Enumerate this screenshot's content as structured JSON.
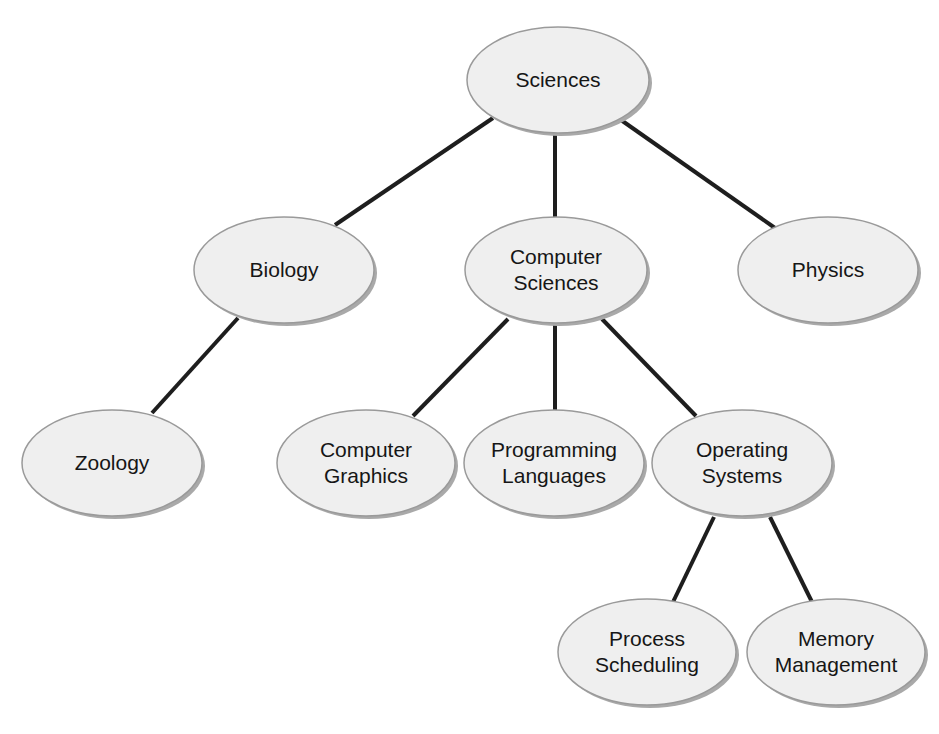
{
  "diagram": {
    "type": "tree",
    "colors": {
      "background": "#ffffff",
      "node_fill": "#efefef",
      "node_stroke": "#9a9a9a",
      "node_shadow": "#a9a9a9",
      "edge": "#1e1e1e",
      "text": "#161616"
    },
    "nodes": [
      {
        "id": "sciences",
        "lines": [
          "Sciences"
        ],
        "cx": 558,
        "cy": 80,
        "rx": 91,
        "ry": 53
      },
      {
        "id": "biology",
        "lines": [
          "Biology"
        ],
        "cx": 284,
        "cy": 270,
        "rx": 90,
        "ry": 53
      },
      {
        "id": "computer-sciences",
        "lines": [
          "Computer",
          "Sciences"
        ],
        "cx": 556,
        "cy": 270,
        "rx": 91,
        "ry": 53
      },
      {
        "id": "physics",
        "lines": [
          "Physics"
        ],
        "cx": 828,
        "cy": 270,
        "rx": 90,
        "ry": 53
      },
      {
        "id": "zoology",
        "lines": [
          "Zoology"
        ],
        "cx": 112,
        "cy": 463,
        "rx": 90,
        "ry": 53
      },
      {
        "id": "computer-graphics",
        "lines": [
          "Computer",
          "Graphics"
        ],
        "cx": 366,
        "cy": 463,
        "rx": 89,
        "ry": 53
      },
      {
        "id": "programming-languages",
        "lines": [
          "Programming",
          "Languages"
        ],
        "cx": 554,
        "cy": 463,
        "rx": 90,
        "ry": 53
      },
      {
        "id": "operating-systems",
        "lines": [
          "Operating",
          "Systems"
        ],
        "cx": 742,
        "cy": 463,
        "rx": 90,
        "ry": 53
      },
      {
        "id": "process-scheduling",
        "lines": [
          "Process",
          "Scheduling"
        ],
        "cx": 647,
        "cy": 652,
        "rx": 89,
        "ry": 53
      },
      {
        "id": "memory-management",
        "lines": [
          "Memory",
          "Management"
        ],
        "cx": 836,
        "cy": 652,
        "rx": 89,
        "ry": 53
      }
    ],
    "edges": [
      {
        "from": "sciences",
        "to": "biology",
        "x1": 493,
        "y1": 118,
        "x2": 335,
        "y2": 225
      },
      {
        "from": "sciences",
        "to": "computer-sciences",
        "x1": 555,
        "y1": 134,
        "x2": 555,
        "y2": 217
      },
      {
        "from": "sciences",
        "to": "physics",
        "x1": 621,
        "y1": 120,
        "x2": 775,
        "y2": 228
      },
      {
        "from": "biology",
        "to": "zoology",
        "x1": 238,
        "y1": 318,
        "x2": 152,
        "y2": 413
      },
      {
        "from": "computer-sciences",
        "to": "computer-graphics",
        "x1": 508,
        "y1": 319,
        "x2": 413,
        "y2": 416
      },
      {
        "from": "computer-sciences",
        "to": "programming-languages",
        "x1": 555,
        "y1": 323,
        "x2": 555,
        "y2": 410
      },
      {
        "from": "computer-sciences",
        "to": "operating-systems",
        "x1": 602,
        "y1": 319,
        "x2": 696,
        "y2": 416
      },
      {
        "from": "operating-systems",
        "to": "process-scheduling",
        "x1": 714,
        "y1": 517,
        "x2": 673,
        "y2": 602
      },
      {
        "from": "operating-systems",
        "to": "memory-management",
        "x1": 770,
        "y1": 517,
        "x2": 812,
        "y2": 602
      }
    ]
  }
}
